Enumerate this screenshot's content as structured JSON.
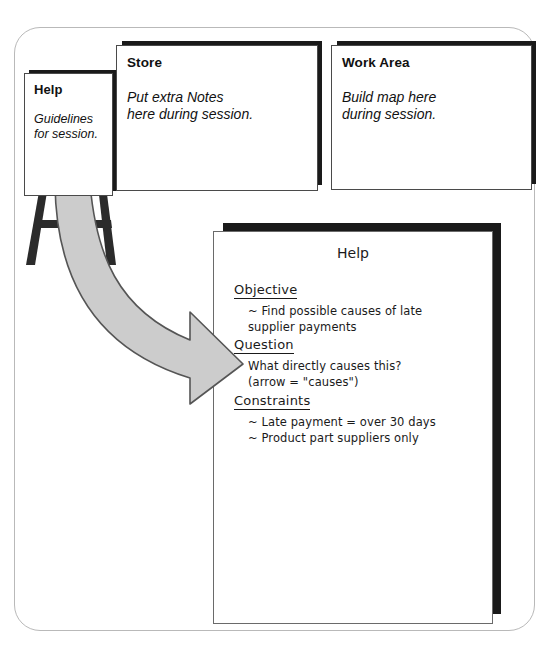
{
  "frame": {
    "name": "workshop-setup-frame"
  },
  "easel_panel": {
    "title": "Help",
    "body": "Guidelines\nfor session."
  },
  "store_panel": {
    "title": "Store",
    "body": "Put extra Notes\nhere during session."
  },
  "work_area_panel": {
    "title": "Work Area",
    "body": "Build map here\nduring session."
  },
  "help_document": {
    "title": "Help",
    "sections": [
      {
        "heading": "Objective",
        "lines": "~ Find possible causes of late\n    supplier payments"
      },
      {
        "heading": "Question",
        "lines": "What directly causes this?\n(arrow = \"causes\")"
      },
      {
        "heading": "Constraints",
        "lines": "~ Late payment = over 30 days\n~ Product part suppliers only"
      }
    ]
  },
  "arrow": {
    "label": "expands-to-arrow"
  },
  "colors": {
    "arrow_fill": "#cccccc",
    "arrow_stroke": "#555555",
    "shadow": "#1a1a1a",
    "frame_border": "#b9b9b9",
    "easel_leg": "#2b2b2b"
  }
}
